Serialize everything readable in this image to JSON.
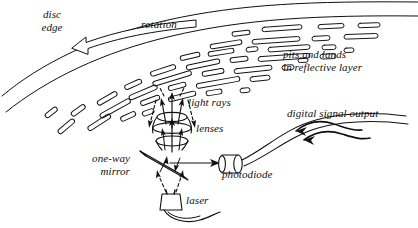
{
  "figure": {
    "background_color": "#ffffff",
    "ink_color": "#101010",
    "width": 418,
    "height": 228
  },
  "labels": {
    "disc_edge": "disc\nedge",
    "rotation": "rotation",
    "pits_and_lands": "pits and lands\nin reflective layer",
    "light_rays": "light rays",
    "lenses": "lenses",
    "one_way_mirror": "one-way\nmirror",
    "photodiode": "photodiode",
    "laser": "laser",
    "digital_signal_output": "digital signal output"
  },
  "parts": [
    {
      "name": "disc-edge-arcs",
      "kind": "arc-band",
      "description": "two long curved lines forming the outer edge of the spinning disc"
    },
    {
      "name": "rotation-arrow",
      "kind": "hollow-arrow",
      "description": "open outlined arrow curving along the disc edge indicating spin direction"
    },
    {
      "name": "pit-track-marks",
      "kind": "pit-array",
      "count": 46,
      "description": "elongated rounded outlines representing pits and lands along concentric tracks"
    },
    {
      "name": "light-ray-beam",
      "kind": "ray-bundle",
      "description": "solid upward arrows and dashed downward arrows between lens stack and disc surface"
    },
    {
      "name": "lens-stack",
      "kind": "lens",
      "count": 3,
      "description": "three biconvex lens elements stacked on the optical axis"
    },
    {
      "name": "one-way-mirror",
      "kind": "mirror",
      "description": "thin tilted parallelogram beam splitter below the lens stack"
    },
    {
      "name": "photodiode-body",
      "kind": "cylinder",
      "description": "small cylindrical detector to the right of the mirror"
    },
    {
      "name": "photodiode-wire",
      "kind": "wire",
      "description": "lead curving up and right from the photodiode"
    },
    {
      "name": "laser-body",
      "kind": "box",
      "description": "small box emitter below the mirror"
    },
    {
      "name": "laser-wire",
      "kind": "wire",
      "description": "lead curving right from the laser"
    },
    {
      "name": "signal-arrow",
      "kind": "wavy-arrow",
      "description": "double wavy arrow representing the digital signal leaving the photodiode"
    }
  ]
}
